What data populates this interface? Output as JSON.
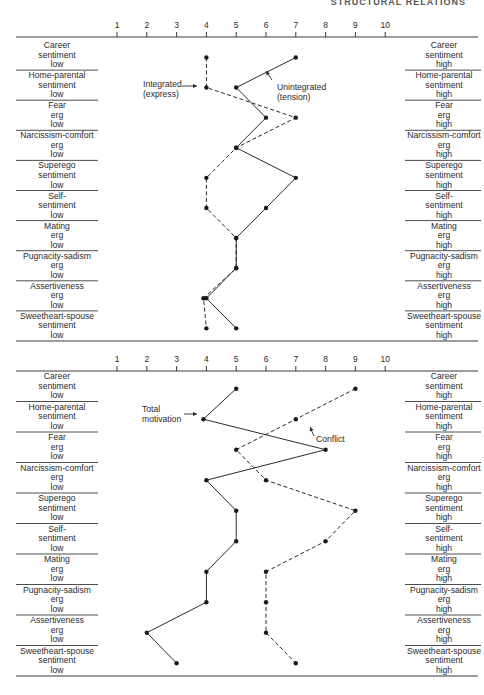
{
  "header": {
    "text": "STRUCTURAL RELATIONS"
  },
  "axis": {
    "ticks": [
      "1",
      "2",
      "3",
      "4",
      "5",
      "6",
      "7",
      "8",
      "9",
      "10"
    ]
  },
  "rows": [
    {
      "left": [
        "Career",
        "sentiment",
        "low"
      ],
      "right": [
        "Career",
        "sentiment",
        "high"
      ]
    },
    {
      "left": [
        "Home-parental",
        "sentiment",
        "low"
      ],
      "right": [
        "Home-parental",
        "sentiment",
        "high"
      ]
    },
    {
      "left": [
        "Fear",
        "erg",
        "low"
      ],
      "right": [
        "Fear",
        "erg",
        "high"
      ]
    },
    {
      "left": [
        "Narcissism-comfort",
        "erg",
        "low"
      ],
      "right": [
        "Narcissism-comfort",
        "erg",
        "high"
      ]
    },
    {
      "left": [
        "Superego",
        "sentiment",
        "low"
      ],
      "right": [
        "Superego",
        "sentiment",
        "high"
      ]
    },
    {
      "left": [
        "Self-",
        "sentiment",
        "low"
      ],
      "right": [
        "Self-",
        "sentiment",
        "high"
      ]
    },
    {
      "left": [
        "Mating",
        "erg",
        "low"
      ],
      "right": [
        "Mating",
        "erg",
        "high"
      ]
    },
    {
      "left": [
        "Pugnacity-sadism",
        "erg",
        "low"
      ],
      "right": [
        "Pugnacity-sadism",
        "erg",
        "high"
      ]
    },
    {
      "left": [
        "Assertiveness",
        "erg",
        "low"
      ],
      "right": [
        "Assertiveness",
        "erg",
        "high"
      ]
    },
    {
      "left": [
        "Sweetheart-spouse",
        "sentiment",
        "low"
      ],
      "right": [
        "Sweetheart-spouse",
        "sentiment",
        "high"
      ]
    }
  ],
  "charts": {
    "top": {
      "annotations": {
        "integrated": [
          "Integrated",
          "(express)"
        ],
        "unintegrated": [
          "Unintegrated",
          "(tension)"
        ]
      }
    },
    "bottom": {
      "annotations": {
        "total": [
          "Total",
          "motivation"
        ],
        "conflict": [
          "Conflict"
        ]
      }
    }
  },
  "chart_data": [
    {
      "type": "line",
      "title": "",
      "orientation": "horizontal-profile",
      "xlabel": "",
      "ylabel": "",
      "xlim": [
        1,
        10
      ],
      "x_ticks": [
        1,
        2,
        3,
        4,
        5,
        6,
        7,
        8,
        9,
        10
      ],
      "categories": [
        "Career sentiment",
        "Home-parental sentiment",
        "Fear erg",
        "Narcissism-comfort erg",
        "Superego sentiment",
        "Self-sentiment",
        "Mating erg",
        "Pugnacity-sadism erg",
        "Assertiveness erg",
        "Sweetheart-spouse sentiment"
      ],
      "series": [
        {
          "name": "Integrated (express)",
          "style": "dashed",
          "values": [
            4,
            4,
            7,
            5,
            4,
            4,
            5,
            5,
            3.9,
            4
          ]
        },
        {
          "name": "Unintegrated (tension)",
          "style": "solid",
          "values": [
            7,
            5,
            6,
            5,
            7,
            6,
            5,
            5,
            4,
            5
          ]
        }
      ],
      "grid": false,
      "legend": "inline annotations with arrows"
    },
    {
      "type": "line",
      "title": "",
      "orientation": "horizontal-profile",
      "xlabel": "",
      "ylabel": "",
      "xlim": [
        1,
        10
      ],
      "x_ticks": [
        1,
        2,
        3,
        4,
        5,
        6,
        7,
        8,
        9,
        10
      ],
      "categories": [
        "Career sentiment",
        "Home-parental sentiment",
        "Fear erg",
        "Narcissism-comfort erg",
        "Superego sentiment",
        "Self-sentiment",
        "Mating erg",
        "Pugnacity-sadism erg",
        "Assertiveness erg",
        "Sweetheart-spouse sentiment"
      ],
      "series": [
        {
          "name": "Total motivation",
          "style": "solid",
          "values": [
            5,
            3.9,
            8,
            4,
            5,
            5,
            4,
            4,
            2,
            3
          ]
        },
        {
          "name": "Conflict",
          "style": "dashed",
          "values": [
            9,
            7,
            5,
            6,
            9,
            8,
            6,
            6,
            6,
            7
          ]
        }
      ],
      "grid": false,
      "legend": "inline annotations with arrows"
    }
  ]
}
